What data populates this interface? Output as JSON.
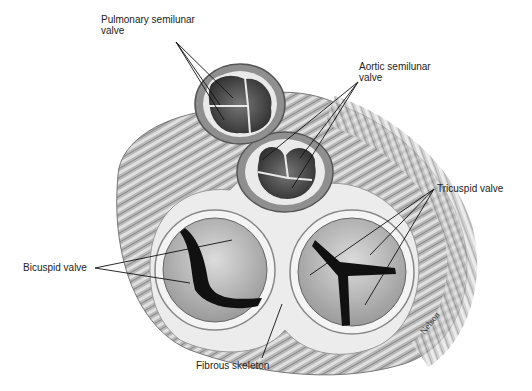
{
  "figure": {
    "labels": {
      "pulmonary": [
        "Pulmonary semilunar",
        "valve"
      ],
      "aortic": [
        "Aortic semilunar",
        "valve"
      ],
      "tricuspid": "Tricuspid valve",
      "bicuspid": "Bicuspid valve",
      "fibrous": "Fibrous skeleton"
    },
    "signature": "Nelson"
  },
  "colors": {
    "background": "#ffffff",
    "muscle": "#a9a9a9",
    "muscle_light": "#d4d4d4",
    "skeleton": "#ececec",
    "valve_dark": "#1a1a1a",
    "leaflet": "#c2c2c2",
    "text": "#222222"
  }
}
